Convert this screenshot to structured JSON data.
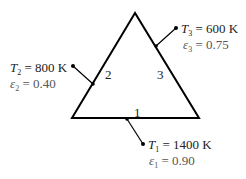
{
  "diagram": {
    "type": "enclosure-triangle",
    "colors": {
      "line": "#000000",
      "text": "#222222",
      "emissivity_text": "#555555"
    },
    "sides": [
      {
        "id": "1",
        "label": "1",
        "T_symbol": "T",
        "T_sub": "1",
        "T_value": "= 1400 K",
        "eps_symbol": "ε",
        "eps_sub": "1",
        "eps_value": "= 0.90"
      },
      {
        "id": "2",
        "label": "2",
        "T_symbol": "T",
        "T_sub": "2",
        "T_value": "= 800 K",
        "eps_symbol": "ε",
        "eps_sub": "2",
        "eps_value": "= 0.40"
      },
      {
        "id": "3",
        "label": "3",
        "T_symbol": "T",
        "T_sub": "3",
        "T_value": "= 600 K",
        "eps_symbol": "ε",
        "eps_sub": "3",
        "eps_value": "= 0.75"
      }
    ]
  }
}
